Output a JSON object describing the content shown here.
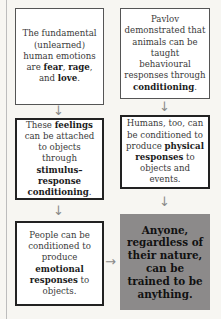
{
  "diagram": {
    "left_column": [
      {
        "parts": [
          {
            "t": "The fundamental (unlearned) human emotions are "
          },
          {
            "t": "fear",
            "b": true
          },
          {
            "t": ", "
          },
          {
            "t": "rage",
            "b": true
          },
          {
            "t": ", and "
          },
          {
            "t": "love",
            "b": true
          },
          {
            "t": "."
          }
        ]
      },
      {
        "parts": [
          {
            "t": "These "
          },
          {
            "t": "feelings",
            "b": true
          },
          {
            "t": " can be attached to objects through "
          },
          {
            "t": "stimulus–response conditioning",
            "b": true
          },
          {
            "t": "."
          }
        ]
      },
      {
        "parts": [
          {
            "t": "People can be conditioned to produce "
          },
          {
            "t": "emotional responses",
            "b": true
          },
          {
            "t": " to objects."
          }
        ]
      }
    ],
    "right_column": [
      {
        "parts": [
          {
            "t": "Pavlov demonstrated that animals can be taught behavioural responses through "
          },
          {
            "t": "conditioning",
            "b": true
          },
          {
            "t": "."
          }
        ]
      },
      {
        "parts": [
          {
            "t": "Humans, too, can be conditioned to produce "
          },
          {
            "t": "physical responses",
            "b": true
          },
          {
            "t": " to objects and events."
          }
        ]
      }
    ],
    "conclusion": "Anyone, regardless of their nature, can be trained to be anything.",
    "arrows": {
      "down": "↓",
      "right": "→"
    },
    "colors": {
      "final_box": "#8c8a8a",
      "border": "#222222",
      "arrow": "#8a8a8a"
    }
  }
}
